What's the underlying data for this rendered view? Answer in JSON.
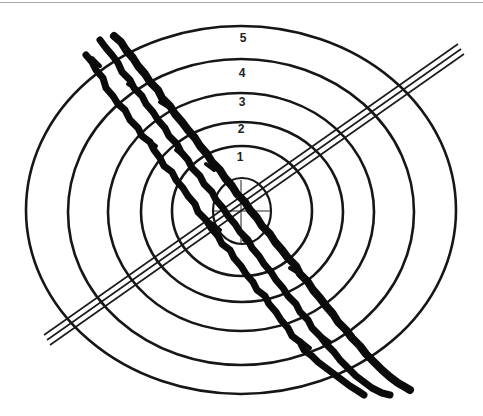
{
  "figure": {
    "type": "target-diagram",
    "ring_labels": [
      "1",
      "2",
      "3",
      "4",
      "5"
    ],
    "colors": {
      "ink": "#161616",
      "background": "#ffffff",
      "top_rule": "#a9a9a9"
    },
    "center": {
      "x": 241,
      "y": 211
    },
    "rings": [
      {
        "label": "inner",
        "rx": 29,
        "ry": 33
      },
      {
        "label": "1",
        "rx": 70,
        "ry": 65
      },
      {
        "label": "2",
        "rx": 101,
        "ry": 90
      },
      {
        "label": "3",
        "rx": 133,
        "ry": 118
      },
      {
        "label": "4",
        "rx": 173,
        "ry": 151
      },
      {
        "label": "5",
        "rx": 215,
        "ry": 184
      }
    ],
    "diagonal_line": {
      "style": "triple-parallel",
      "from": [
        47,
        340
      ],
      "to": [
        462,
        48
      ]
    },
    "scribble_strokes": 3
  }
}
